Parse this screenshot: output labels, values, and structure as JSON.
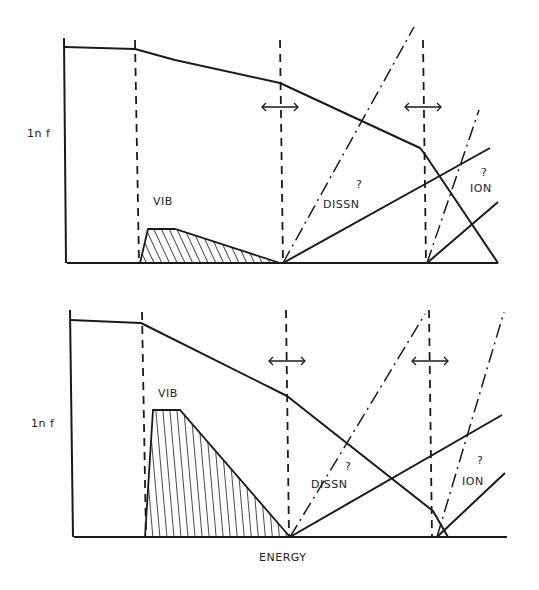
{
  "figure": {
    "panels": [
      {
        "id": "top",
        "y_axis_label": "1n f",
        "region_labels": {
          "vib": "VIB",
          "dissn": "DISSN",
          "ion": "ION"
        },
        "uncertainty_marks": [
          "?",
          "?"
        ]
      },
      {
        "id": "bottom",
        "y_axis_label": "1n f",
        "region_labels": {
          "vib": "VIB",
          "dissn": "DISSN",
          "ion": "ION"
        },
        "uncertainty_marks": [
          "?",
          "?"
        ]
      }
    ],
    "x_axis_label": "ENERGY"
  },
  "colors": {
    "ink": "#1a1a1a",
    "background": "#ffffff"
  }
}
